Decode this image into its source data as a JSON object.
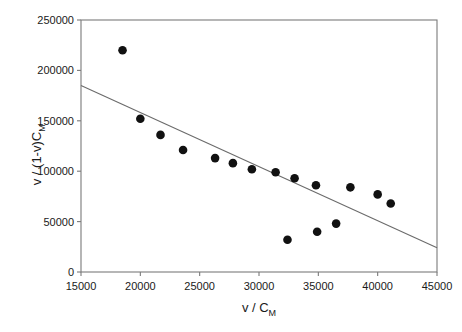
{
  "chart_data": {
    "type": "scatter",
    "title": "",
    "xlabel": "v / C_M",
    "xlabel_main": "v / C",
    "xlabel_sub": "M",
    "ylabel": "v / (1-v)C_M",
    "ylabel_main": "v / (1-v)C",
    "ylabel_sub": "M",
    "xlim": [
      15000,
      45000
    ],
    "ylim": [
      0,
      250000
    ],
    "xticks": [
      15000,
      20000,
      25000,
      30000,
      35000,
      40000,
      45000
    ],
    "yticks": [
      0,
      50000,
      100000,
      150000,
      200000,
      250000
    ],
    "xtick_labels": [
      "15000",
      "20000",
      "25000",
      "30000",
      "35000",
      "40000",
      "45000"
    ],
    "ytick_labels": [
      "0",
      "50000",
      "100000",
      "150000",
      "200000",
      "250000"
    ],
    "grid": false,
    "legend": false,
    "marker_color": "#111111",
    "marker_size": 6,
    "line_color": "#6b6b6b",
    "axis_color": "#7a7a7a",
    "series": [
      {
        "name": "data",
        "type": "scatter",
        "points": [
          [
            18500,
            220000
          ],
          [
            20000,
            152000
          ],
          [
            21700,
            136000
          ],
          [
            23600,
            121000
          ],
          [
            26300,
            113000
          ],
          [
            27800,
            108000
          ],
          [
            29400,
            102000
          ],
          [
            31400,
            99000
          ],
          [
            32400,
            32000
          ],
          [
            33000,
            93000
          ],
          [
            34800,
            86000
          ],
          [
            34900,
            40000
          ],
          [
            36500,
            48000
          ],
          [
            37700,
            84000
          ],
          [
            40000,
            77000
          ],
          [
            41100,
            68000
          ]
        ]
      },
      {
        "name": "trend-line",
        "type": "line",
        "points": [
          [
            15000,
            185000
          ],
          [
            45000,
            24000
          ]
        ]
      }
    ]
  }
}
